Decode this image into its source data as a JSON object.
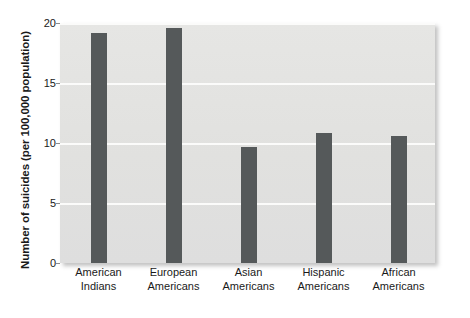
{
  "chart_data": {
    "type": "bar",
    "title": "",
    "xlabel": "",
    "ylabel": "Number of suicides (per 100,000 population)",
    "categories": [
      "American Indians",
      "European Americans",
      "Asian Americans",
      "Hispanic Americans",
      "African Americans"
    ],
    "category_lines": [
      [
        "American",
        "Indians"
      ],
      [
        "European",
        "Americans"
      ],
      [
        "Asian",
        "Americans"
      ],
      [
        "Hispanic",
        "Americans"
      ],
      [
        "African",
        "Americans"
      ]
    ],
    "values": [
      19.2,
      19.6,
      9.7,
      10.8,
      10.6
    ],
    "ylim": [
      0,
      20
    ],
    "yticks": [
      0,
      5,
      10,
      15,
      20
    ],
    "ytick_labels": [
      "0",
      "5",
      "10",
      "15",
      "20"
    ],
    "grid": true,
    "legend": false,
    "legend_position": "none",
    "bar_color": "#55595a",
    "plot_background_color": "#e2e2e0",
    "gridline_color": "#fbfbfa",
    "text_color": "#1a1a1a"
  }
}
